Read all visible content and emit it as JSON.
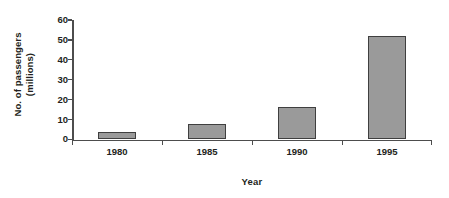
{
  "chart_data": {
    "type": "bar",
    "title": "",
    "xlabel": "Year",
    "ylabel": "No. of passengers (millions)",
    "ylabel_line1": "No. of passengers",
    "ylabel_line2": "(millions)",
    "categories": [
      "1980",
      "1985",
      "1990",
      "1995"
    ],
    "values": [
      3.5,
      8,
      16.5,
      52
    ],
    "series": [
      {
        "name": "No. of passengers (millions)",
        "values": [
          3.5,
          8,
          16.5,
          52
        ]
      }
    ],
    "ylim": [
      0,
      60
    ],
    "ytick_values": [
      0,
      10,
      20,
      30,
      40,
      50,
      60
    ],
    "ytick_labels": [
      "0",
      "10",
      "20",
      "30",
      "40",
      "50",
      "60"
    ],
    "grid": false,
    "legend": false,
    "legend_position": "none",
    "bar_fill_color": "#9a9a9a",
    "bar_border_color": "#3f3f3f",
    "axis_color": "#4d4d4d",
    "background_color": "#ffffff"
  }
}
